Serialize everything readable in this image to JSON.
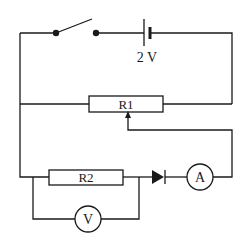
{
  "diagram": {
    "type": "circuit",
    "colors": {
      "wire": "#1a1a1a",
      "background": "#ffffff"
    },
    "components": {
      "switch": {
        "label": "",
        "state": "open"
      },
      "battery": {
        "label": "2 V"
      },
      "rheostat": {
        "label": "R1"
      },
      "resistor": {
        "label": "R2"
      },
      "diode": {
        "label": ""
      },
      "ammeter": {
        "label": "A"
      },
      "voltmeter": {
        "label": "V"
      }
    }
  }
}
